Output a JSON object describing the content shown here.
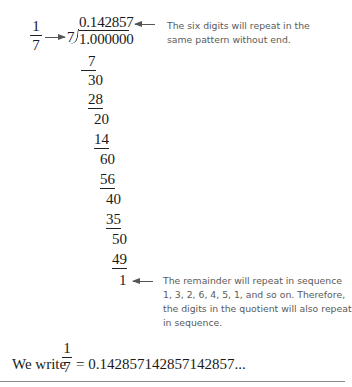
{
  "problem": {
    "fraction": {
      "numerator": "1",
      "denominator": "7"
    },
    "divisor": "7",
    "dividend": "1.000000",
    "quotient": "0.142857",
    "steps": [
      {
        "value": "7",
        "underlined": true
      },
      {
        "value": "30",
        "underlined": false
      },
      {
        "value": "28",
        "underlined": true
      },
      {
        "value": "20",
        "underlined": false
      },
      {
        "value": "14",
        "underlined": true
      },
      {
        "value": "60",
        "underlined": false
      },
      {
        "value": "56",
        "underlined": true
      },
      {
        "value": "40",
        "underlined": false
      },
      {
        "value": "35",
        "underlined": true
      },
      {
        "value": "50",
        "underlined": false
      },
      {
        "value": "49",
        "underlined": true
      },
      {
        "value": "1",
        "underlined": false
      }
    ]
  },
  "annotations": {
    "quotient_note": {
      "line1": "The six digits will repeat in the",
      "line2": "same pattern without end."
    },
    "remainder_note": {
      "line1": "The remainder will repeat in sequence",
      "line2": "1, 3, 2, 6, 4, 5, 1, and so on.  Therefore,",
      "line3": "the digits in the quotient will also repeat",
      "line4": "in sequence."
    }
  },
  "conclusion": {
    "prefix": "We write",
    "fraction": {
      "numerator": "1",
      "denominator": "7"
    },
    "result": "= 0.142857142857142857..."
  },
  "colors": {
    "text": "#1a1a1a",
    "note_text": "#5a5a5a",
    "rule": "#8a8a8a"
  }
}
